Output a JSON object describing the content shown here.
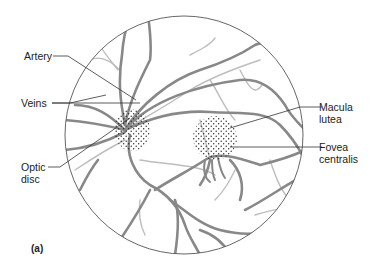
{
  "figure": {
    "panel_label": "(a)"
  },
  "labels": {
    "artery": "Artery",
    "veins": "Veins",
    "optic_disc_line1": "Optic",
    "optic_disc_line2": "disc",
    "macula_line1": "Macula",
    "macula_line2": "lutea",
    "fovea_line1": "Fovea",
    "fovea_line2": "centralis"
  },
  "colors": {
    "outline": "#555555",
    "vein": "#8a8a8a",
    "artery": "#b5b5b5",
    "dots": "#222222",
    "leader": "#333333"
  }
}
